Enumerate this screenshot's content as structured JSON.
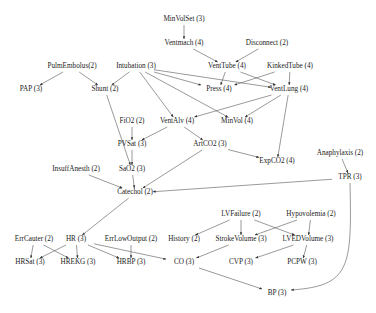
{
  "diagram": {
    "type": "bayesian-network",
    "nodes": [
      {
        "id": "MinVolSet",
        "label": "MinVolSet (3)",
        "x": 184,
        "y": 20
      },
      {
        "id": "Ventmach",
        "label": "Ventmach (4)",
        "x": 184,
        "y": 44
      },
      {
        "id": "Disconnect",
        "label": "Disconnect (2)",
        "x": 267,
        "y": 44
      },
      {
        "id": "PulmEmbolus",
        "label": "PulmEmbolus(2)",
        "x": 72,
        "y": 67
      },
      {
        "id": "Intubation",
        "label": "Intubation (3)",
        "x": 136,
        "y": 67
      },
      {
        "id": "VentTube",
        "label": "VentTube (4)",
        "x": 227,
        "y": 67
      },
      {
        "id": "KinkedTube",
        "label": "KinkedTube (4)",
        "x": 290,
        "y": 67
      },
      {
        "id": "PAP",
        "label": "PAP (3)",
        "x": 31,
        "y": 90
      },
      {
        "id": "Shunt",
        "label": "Shunt (2)",
        "x": 105,
        "y": 90
      },
      {
        "id": "Press",
        "label": "Press (4)",
        "x": 219,
        "y": 90
      },
      {
        "id": "VentLung",
        "label": "VentLung (4)",
        "x": 289,
        "y": 90
      },
      {
        "id": "FiO2",
        "label": "FiO2 (2)",
        "x": 132,
        "y": 122
      },
      {
        "id": "VentAlv",
        "label": "VentAlv (4)",
        "x": 177,
        "y": 122
      },
      {
        "id": "MinVol",
        "label": "MinVol (4)",
        "x": 237,
        "y": 122
      },
      {
        "id": "PVSat",
        "label": "PVSat (3)",
        "x": 132,
        "y": 145
      },
      {
        "id": "ArtCO2",
        "label": "ArtCO2 (3)",
        "x": 210,
        "y": 145
      },
      {
        "id": "ExpCO2",
        "label": "ExpCO2 (4)",
        "x": 277,
        "y": 162
      },
      {
        "id": "Anaphylaxis",
        "label": "Anaphylaxis (2)",
        "x": 340,
        "y": 154
      },
      {
        "id": "InsuffAnesth",
        "label": "InsuffAnesth (2)",
        "x": 76,
        "y": 170
      },
      {
        "id": "SaO2",
        "label": "SaO2 (3)",
        "x": 132,
        "y": 170
      },
      {
        "id": "TPR",
        "label": "TPR (3)",
        "x": 350,
        "y": 178
      },
      {
        "id": "Catechol",
        "label": "Catechol (2)",
        "x": 135,
        "y": 193
      },
      {
        "id": "LVFailure",
        "label": "LVFailure (2)",
        "x": 241,
        "y": 215
      },
      {
        "id": "Hypovolemia",
        "label": "Hypovolemia (2)",
        "x": 311,
        "y": 215
      },
      {
        "id": "ErrCauter",
        "label": "ErrCauter (2)",
        "x": 34,
        "y": 240
      },
      {
        "id": "HR",
        "label": "HR (3)",
        "x": 76,
        "y": 240
      },
      {
        "id": "ErrLowOutput",
        "label": "ErrLowOutput (2)",
        "x": 131,
        "y": 240
      },
      {
        "id": "History",
        "label": "History (2)",
        "x": 184,
        "y": 240
      },
      {
        "id": "StrokeVolume",
        "label": "StrokeVolume (3)",
        "x": 241,
        "y": 240
      },
      {
        "id": "LVEDVolume",
        "label": "LVEDVolume (3)",
        "x": 308,
        "y": 240
      },
      {
        "id": "HRSat",
        "label": "HRSat (3)",
        "x": 30,
        "y": 263
      },
      {
        "id": "HREKG",
        "label": "HREKG (3)",
        "x": 78,
        "y": 263
      },
      {
        "id": "HRBP",
        "label": "HRBP (3)",
        "x": 131,
        "y": 263
      },
      {
        "id": "CO",
        "label": "CO (3)",
        "x": 184,
        "y": 263
      },
      {
        "id": "CVP",
        "label": "CVP (3)",
        "x": 241,
        "y": 263
      },
      {
        "id": "PCPW",
        "label": "PCPW (3)",
        "x": 302,
        "y": 263
      },
      {
        "id": "BP",
        "label": "BP (3)",
        "x": 277,
        "y": 294
      }
    ],
    "edges": [
      [
        "MinVolSet",
        "Ventmach"
      ],
      [
        "Ventmach",
        "VentTube"
      ],
      [
        "Disconnect",
        "VentTube"
      ],
      [
        "PulmEmbolus",
        "PAP"
      ],
      [
        "PulmEmbolus",
        "Shunt"
      ],
      [
        "Intubation",
        "Shunt"
      ],
      [
        "Intubation",
        "Press"
      ],
      [
        "Intubation",
        "VentLung"
      ],
      [
        "Intubation",
        "VentAlv"
      ],
      [
        "Intubation",
        "MinVol"
      ],
      [
        "VentTube",
        "Press"
      ],
      [
        "VentTube",
        "VentLung"
      ],
      [
        "KinkedTube",
        "Press"
      ],
      [
        "KinkedTube",
        "VentLung"
      ],
      [
        "VentLung",
        "VentAlv"
      ],
      [
        "VentLung",
        "MinVol"
      ],
      [
        "VentLung",
        "ExpCO2"
      ],
      [
        "Shunt",
        "SaO2"
      ],
      [
        "FiO2",
        "PVSat"
      ],
      [
        "VentAlv",
        "PVSat"
      ],
      [
        "VentAlv",
        "ArtCO2"
      ],
      [
        "PVSat",
        "SaO2"
      ],
      [
        "ArtCO2",
        "ExpCO2"
      ],
      [
        "ArtCO2",
        "Catechol"
      ],
      [
        "SaO2",
        "Catechol"
      ],
      [
        "InsuffAnesth",
        "Catechol"
      ],
      [
        "Anaphylaxis",
        "TPR"
      ],
      [
        "TPR",
        "Catechol"
      ],
      [
        "TPR",
        "BP"
      ],
      [
        "Catechol",
        "HR"
      ],
      [
        "ErrCauter",
        "HRSat"
      ],
      [
        "ErrCauter",
        "HREKG"
      ],
      [
        "HR",
        "HRSat"
      ],
      [
        "HR",
        "HREKG"
      ],
      [
        "HR",
        "HRBP"
      ],
      [
        "HR",
        "CO"
      ],
      [
        "ErrLowOutput",
        "HRBP"
      ],
      [
        "LVFailure",
        "History"
      ],
      [
        "LVFailure",
        "StrokeVolume"
      ],
      [
        "LVFailure",
        "LVEDVolume"
      ],
      [
        "Hypovolemia",
        "StrokeVolume"
      ],
      [
        "Hypovolemia",
        "LVEDVolume"
      ],
      [
        "StrokeVolume",
        "CO"
      ],
      [
        "LVEDVolume",
        "CVP"
      ],
      [
        "LVEDVolume",
        "PCPW"
      ],
      [
        "CO",
        "BP"
      ]
    ],
    "colors": {
      "edge": "#555555",
      "text": "#222222",
      "background": "#ffffff"
    }
  }
}
